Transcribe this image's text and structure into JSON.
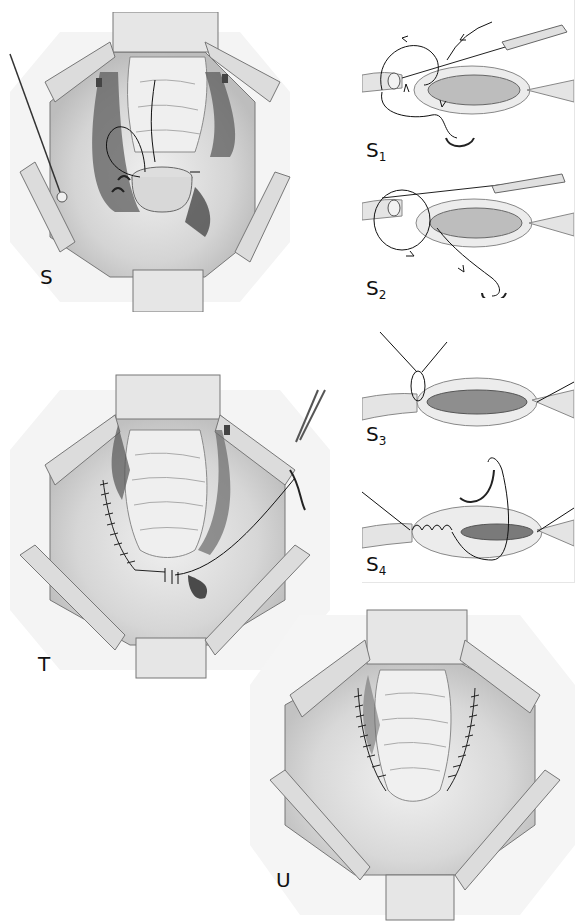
{
  "page": {
    "header_cropped": true,
    "background": "#ffffff"
  },
  "panels": {
    "S": {
      "label": "S",
      "description": "Surgical field view with retractors, sutures and forceps"
    },
    "T": {
      "label": "T",
      "description": "Surgical field view with running suture line and needle holder"
    },
    "U": {
      "label": "U",
      "description": "Surgical field view with completed bilateral suture lines"
    }
  },
  "insets": [
    {
      "id": "S1",
      "letter": "S",
      "subscript": "1"
    },
    {
      "id": "S2",
      "letter": "S",
      "subscript": "2"
    },
    {
      "id": "S3",
      "letter": "S",
      "subscript": "3"
    },
    {
      "id": "S4",
      "letter": "S",
      "subscript": "4"
    }
  ],
  "colors": {
    "ink": "#1a1a1a",
    "tissue_light": "#ececec",
    "tissue_mid": "#c9c9c9",
    "tissue_dark": "#6e6e6e",
    "retractor": "#e2e2e2"
  }
}
